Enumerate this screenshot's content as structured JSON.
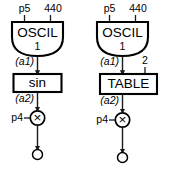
{
  "diagram": {
    "stroke_color": "#000000",
    "background_color": "#ffffff",
    "branches": [
      {
        "id": "sin-branch",
        "oscillator": {
          "label": "OSCIL",
          "subscript": "1",
          "inputs": [
            {
              "label": "p5"
            },
            {
              "label": "440"
            }
          ]
        },
        "signal_out": "(a1)",
        "unit": {
          "label": "sin",
          "extra_input": null
        },
        "signal_mid": "(a2)",
        "multiplier": {
          "glyph": "×",
          "amplitude": "p4"
        }
      },
      {
        "id": "table-branch",
        "oscillator": {
          "label": "OSCIL",
          "subscript": "1",
          "inputs": [
            {
              "label": "p5"
            },
            {
              "label": "440"
            }
          ]
        },
        "signal_out": "(a1)",
        "unit": {
          "label": "TABLE",
          "extra_input": "2"
        },
        "signal_mid": "(a2)",
        "multiplier": {
          "glyph": "×",
          "amplitude": "p4"
        }
      }
    ]
  }
}
